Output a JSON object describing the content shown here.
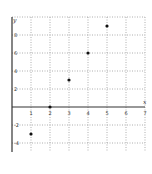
{
  "chart_data": {
    "type": "scatter",
    "title": "",
    "xlabel": "x",
    "ylabel": "y",
    "xlim": [
      0,
      7
    ],
    "ylim": [
      -5,
      10
    ],
    "grid": true,
    "x_ticks": [
      1,
      2,
      3,
      4,
      5,
      6,
      7
    ],
    "x_tick_labels": [
      "1",
      "2",
      "3",
      "4",
      "5",
      "6",
      "7"
    ],
    "y_ticks": [
      8,
      6,
      4,
      2,
      -2,
      -4
    ],
    "y_tick_labels": [
      "8",
      "6",
      "4",
      "2",
      "-2",
      "-4"
    ],
    "x_grid": [
      1,
      2,
      3,
      4,
      5,
      6,
      7
    ],
    "y_grid": [
      10,
      8,
      6,
      4,
      2,
      -2,
      -4
    ],
    "series": [
      {
        "name": "points",
        "x": [
          1,
          2,
          3,
          4,
          5
        ],
        "y": [
          -3,
          0,
          3,
          6,
          9
        ]
      }
    ]
  }
}
